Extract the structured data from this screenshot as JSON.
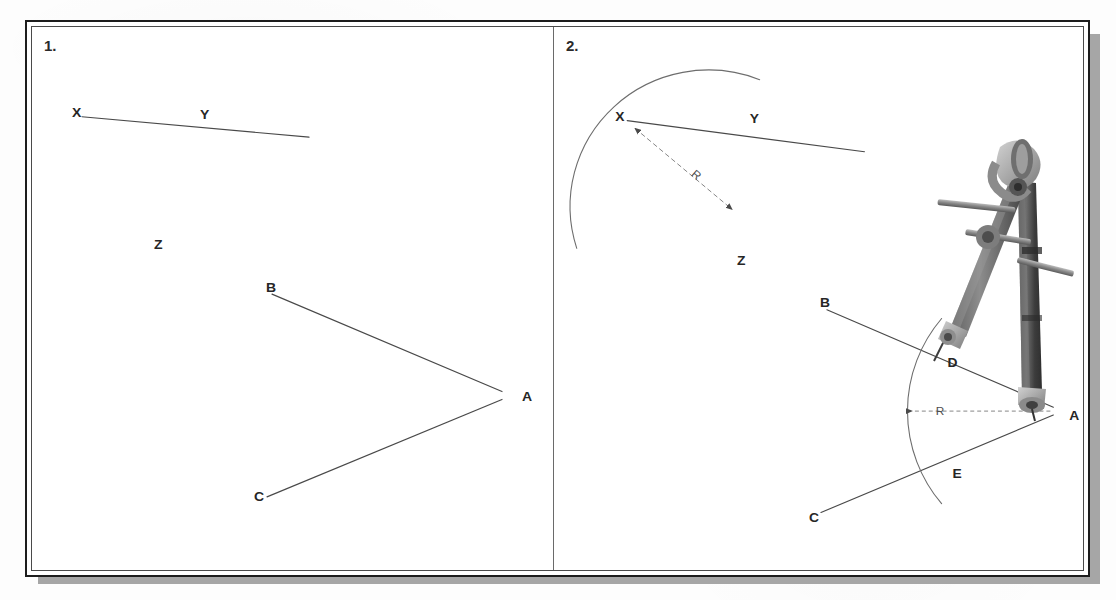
{
  "document": {
    "type": "technical-drawing-instruction-sheet",
    "description": "Two-panel step-by-step construction: bisecting a line and an angle using a compass",
    "background_color": "#fdfdfd",
    "frame_border_color": "#1d1d1d",
    "shadow_color": "#a6a6a6"
  },
  "panels": [
    {
      "id": "panel-1",
      "step_number": "1.",
      "figures": [
        {
          "name": "line-xy",
          "labels": [
            {
              "text": "X",
              "x": 40,
              "y": 86
            },
            {
              "text": "Y",
              "x": 168,
              "y": 88
            },
            {
              "text": "Z",
              "x": 122,
              "y": 222
            }
          ],
          "segments": [
            {
              "x1": 50,
              "y1": 92,
              "x2": 277,
              "y2": 113
            }
          ]
        },
        {
          "name": "angle-bac",
          "labels": [
            {
              "text": "B",
              "x": 234,
              "y": 266
            },
            {
              "text": "A",
              "x": 490,
              "y": 378
            },
            {
              "text": "C",
              "x": 222,
              "y": 480
            }
          ],
          "segments": [
            {
              "x1": 240,
              "y1": 274,
              "x2": 470,
              "y2": 374
            },
            {
              "x1": 470,
              "y1": 382,
              "x2": 235,
              "y2": 482
            }
          ]
        }
      ]
    },
    {
      "id": "panel-2",
      "step_number": "2.",
      "figures": [
        {
          "name": "line-xy-with-arc",
          "labels": [
            {
              "text": "X",
              "x": 62,
              "y": 90
            },
            {
              "text": "Y",
              "x": 198,
              "y": 92
            },
            {
              "text": "Z",
              "x": 185,
              "y": 238
            },
            {
              "text": "R",
              "x": 145,
              "y": 148
            }
          ],
          "segments": [
            {
              "x1": 74,
              "y1": 96,
              "x2": 314,
              "y2": 128
            }
          ],
          "arc": {
            "center_x": 75,
            "center_y": 97,
            "radius": 140,
            "start_angle_deg": -18,
            "end_angle_deg": 68
          },
          "radius_arrow": {
            "from_x": 80,
            "from_y": 102,
            "to_x": 183,
            "to_y": 190,
            "double_headed": true
          }
        },
        {
          "name": "angle-bac-with-arc",
          "labels": [
            {
              "text": "B",
              "x": 269,
              "y": 281
            },
            {
              "text": "D",
              "x": 398,
              "y": 343
            },
            {
              "text": "A",
              "x": 521,
              "y": 397
            },
            {
              "text": "E",
              "x": 403,
              "y": 457
            },
            {
              "text": "C",
              "x": 258,
              "y": 502
            },
            {
              "text": "R",
              "x": 358,
              "y": 392
            }
          ],
          "segments": [
            {
              "x1": 276,
              "y1": 290,
              "x2": 505,
              "y2": 390
            },
            {
              "x1": 505,
              "y1": 398,
              "x2": 270,
              "y2": 498
            }
          ],
          "arc": {
            "center_x": 508,
            "center_y": 394,
            "radius": 148,
            "start_angle_deg": 140,
            "end_angle_deg": 222
          },
          "radius_dimension": {
            "from_x": 505,
            "from_y": 394,
            "to_x": 362,
            "to_y": 394,
            "arrow_at": "left"
          }
        }
      ],
      "tool": {
        "name": "compass",
        "alt": "metal drawing compass with point leg and pencil leg",
        "body_color": "#5c5c5c",
        "highlight_color": "#b9b9b9",
        "shadow_color": "#3a3a3a",
        "pivot_x": 520,
        "pivot_y": 398
      }
    }
  ]
}
